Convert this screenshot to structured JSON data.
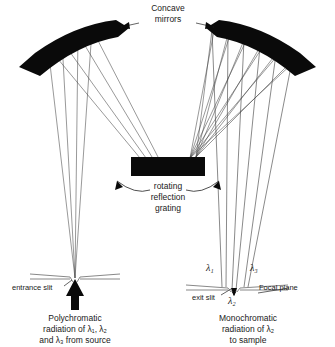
{
  "diagram": {
    "title_label": "Concave mirrors",
    "labels": {
      "concave_mirrors_line1": "Concave",
      "concave_mirrors_line2": "mirrors",
      "grating_line1": "rotating",
      "grating_line2": "reflection",
      "grating_line3": "grating",
      "entrance_slit": "entrance slit",
      "exit_slit": "exit slit",
      "focal_plane": "Focal plane",
      "source_line1": "Polychromatic",
      "source_line2": "radiation of λ₁, λ₂",
      "source_line3": "and λ₃ from source",
      "output_line1": "Monochromatic",
      "output_line2": "radiation of λ₂",
      "output_line3": "to sample"
    },
    "wavelengths": {
      "lambda1": "λ₁",
      "lambda2": "λ₂",
      "lambda3": "λ₃"
    },
    "colors": {
      "ink": "#0a0a0a",
      "ray": "#444444",
      "background": "#ffffff"
    },
    "components": [
      {
        "name": "left-concave-mirror",
        "kind": "mirror"
      },
      {
        "name": "right-concave-mirror",
        "kind": "mirror"
      },
      {
        "name": "reflection-grating",
        "kind": "grating"
      },
      {
        "name": "entrance-slit",
        "kind": "slit"
      },
      {
        "name": "exit-slit",
        "kind": "slit"
      },
      {
        "name": "focal-plane",
        "kind": "plane"
      }
    ]
  }
}
